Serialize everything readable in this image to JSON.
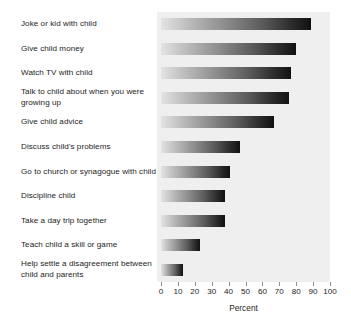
{
  "chart_data": {
    "type": "bar",
    "orientation": "horizontal",
    "title": "",
    "xlabel": "Percent",
    "ylabel": "",
    "xlim": [
      0,
      100
    ],
    "xticks": [
      "0",
      "10",
      "20",
      "30",
      "40",
      "50",
      "60",
      "70",
      "80",
      "90",
      "100"
    ],
    "grid": false,
    "legend": false,
    "categories": [
      "Joke or kid with child",
      "Give child money",
      "Watch TV with child",
      "Talk to child about when you were growing up",
      "Give child advice",
      "Discuss child's problems",
      "Go to church or synagogue with child",
      "Discipline child",
      "Take a day trip together",
      "Teach child a skill or game",
      "Help settle a disagreement between child and parents"
    ],
    "values": [
      89,
      80,
      77,
      76,
      67,
      47,
      41,
      38,
      38,
      23,
      13
    ]
  },
  "style": {
    "panel_background": "#efefef",
    "bar_gradient_start": "#e3e3e3",
    "bar_gradient_end": "#111111",
    "text_color": "#1d1d1d",
    "tick_color": "#8c8c8c"
  }
}
